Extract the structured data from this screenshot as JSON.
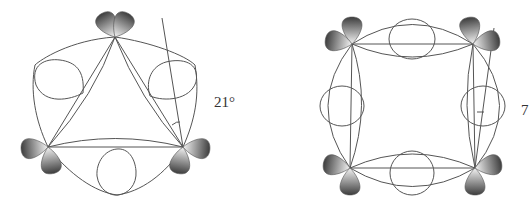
{
  "diagram": {
    "left": {
      "shape": "triangle",
      "angle_label": "21°",
      "description": "cyclopropane bent bonds, three carbon centers with p-orbital lobes"
    },
    "right": {
      "shape": "square",
      "angle_label": "7",
      "description": "cyclobutane bent bonds, four carbon centers with p-orbital lobes"
    },
    "colors": {
      "line": "#555555",
      "lobe_dark": "#4a4a4a",
      "lobe_light": "#f2f2f2"
    }
  }
}
